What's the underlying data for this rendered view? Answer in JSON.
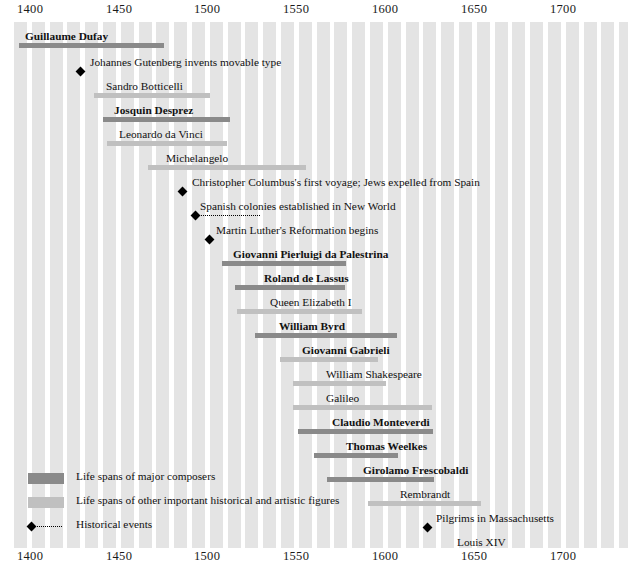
{
  "chart_data": {
    "type": "bar",
    "xlabel": "Year",
    "ylabel": "",
    "xlim": [
      1400,
      1745
    ],
    "grid": "vertical alternating bands every 10 years",
    "legend_position": "bottom-left",
    "axis": {
      "ticks": [
        1400,
        1450,
        1500,
        1550,
        1600,
        1650,
        1700
      ],
      "tick_labels": [
        "1400",
        "1450",
        "1500",
        "1550",
        "1600",
        "1650",
        "1700"
      ],
      "shown_top": true,
      "shown_bottom": true
    },
    "series": [
      {
        "name": "Life spans of major composers",
        "color": "#8a8a8a",
        "items": [
          {
            "label": "Guillaume Dufay",
            "start": 1400,
            "end": 1474
          },
          {
            "label": "Josquin Desprez",
            "start": 1450,
            "end": 1521
          },
          {
            "label": "Giovanni Pierluigi da Palestrina",
            "start": 1525,
            "end": 1594
          },
          {
            "label": "Roland de Lassus",
            "start": 1532,
            "end": 1594
          },
          {
            "label": "William Byrd",
            "start": 1543,
            "end": 1623
          },
          {
            "label": "Giovanni Gabrieli",
            "start": 1557,
            "end": 1612
          },
          {
            "label": "Claudio Monteverdi",
            "start": 1567,
            "end": 1643
          },
          {
            "label": "Thomas Weelkes",
            "start": 1576,
            "end": 1623
          },
          {
            "label": "Girolamo Frescobaldi",
            "start": 1583,
            "end": 1643
          },
          {
            "label": "Henry Purcell",
            "start": 1659,
            "end": 1695
          }
        ]
      },
      {
        "name": "Life spans of other important historical and artistic figures",
        "color": "#c0c0c0",
        "items": [
          {
            "label": "Sandro Botticelli",
            "start": 1445,
            "end": 1510
          },
          {
            "label": "Leonardo da Vinci",
            "start": 1452,
            "end": 1519
          },
          {
            "label": "Michelangelo",
            "start": 1475,
            "end": 1564
          },
          {
            "label": "Queen Elizabeth I",
            "start": 1533,
            "end": 1603
          },
          {
            "label": "William Shakespeare",
            "start": 1564,
            "end": 1616
          },
          {
            "label": "Galileo",
            "start": 1564,
            "end": 1642
          },
          {
            "label": "Rembrandt",
            "start": 1606,
            "end": 1669
          },
          {
            "label": "Louis XIV",
            "start": 1638,
            "end": 1715
          },
          {
            "label": "Isaac Newton",
            "start": 1642,
            "end": 1727
          }
        ]
      },
      {
        "name": "Historical events",
        "color": "#000000",
        "items": [
          {
            "label": "Johannes Gutenberg invents movable type",
            "start": 1439,
            "end": 1439
          },
          {
            "label": "Christopher Columbus's first voyage; Jews expelled from Spain",
            "start": 1492,
            "end": 1492
          },
          {
            "label": "Spanish colonies established in New World",
            "start": 1500,
            "end": 1535
          },
          {
            "label": "Martin Luther's Reformation begins",
            "start": 1517,
            "end": 1517
          },
          {
            "label": "Pilgrims in Massachusetts",
            "start": 1620,
            "end": 1620
          }
        ]
      }
    ]
  },
  "axis_ticks": [
    {
      "label": "1400",
      "x": 17
    },
    {
      "label": "1450",
      "x": 106
    },
    {
      "label": "1500",
      "x": 194
    },
    {
      "label": "1550",
      "x": 283
    },
    {
      "label": "1600",
      "x": 372
    },
    {
      "label": "1650",
      "x": 461
    },
    {
      "label": "1700",
      "x": 550
    }
  ],
  "rows": [
    {
      "kind": "composer",
      "label": "Guillaume Dufay",
      "bold": true,
      "top": 8,
      "labelX": 11,
      "barX": 5,
      "barW": 145
    },
    {
      "kind": "event",
      "label": "Johannes Gutenberg invents movable type",
      "bold": false,
      "top": 34,
      "labelX": 76,
      "barX": 63,
      "barW": 0
    },
    {
      "kind": "figure",
      "label": "Sandro Botticelli",
      "bold": false,
      "top": 58,
      "labelX": 92,
      "barX": 80,
      "barW": 116
    },
    {
      "kind": "composer",
      "label": "Josquin Desprez",
      "bold": true,
      "top": 82,
      "labelX": 100,
      "barX": 89,
      "barW": 127
    },
    {
      "kind": "figure",
      "label": "Leonardo da Vinci",
      "bold": false,
      "top": 106,
      "labelX": 105,
      "barX": 93,
      "barW": 120
    },
    {
      "kind": "figure",
      "label": "Michelangelo",
      "bold": false,
      "top": 130,
      "labelX": 152,
      "barX": 134,
      "barW": 158
    },
    {
      "kind": "event",
      "label": "Christopher Columbus's first voyage; Jews expelled from Spain",
      "bold": false,
      "top": 154,
      "labelX": 178,
      "barX": 165,
      "barW": 0
    },
    {
      "kind": "event",
      "label": "Spanish colonies established in New World",
      "bold": false,
      "top": 178,
      "labelX": 186,
      "barX": 178,
      "barW": 62
    },
    {
      "kind": "event",
      "label": "Martin Luther's Reformation begins",
      "bold": false,
      "top": 202,
      "labelX": 202,
      "barX": 192,
      "barW": 0
    },
    {
      "kind": "composer",
      "label": "Giovanni Pierluigi da Palestrina",
      "bold": true,
      "top": 226,
      "labelX": 219,
      "barX": 208,
      "barW": 124
    },
    {
      "kind": "composer",
      "label": "Roland de Lassus",
      "bold": true,
      "top": 250,
      "labelX": 250,
      "barX": 221,
      "barW": 110
    },
    {
      "kind": "figure",
      "label": "Queen Elizabeth I",
      "bold": false,
      "top": 274,
      "labelX": 256,
      "barX": 223,
      "barW": 125
    },
    {
      "kind": "composer",
      "label": "William Byrd",
      "bold": true,
      "top": 298,
      "labelX": 265,
      "barX": 241,
      "barW": 142
    },
    {
      "kind": "figure",
      "label": "Giovanni Gabrieli",
      "bold": true,
      "top": 322,
      "labelX": 288,
      "barX": 266,
      "barW": 98
    },
    {
      "kind": "figure",
      "label": "William Shakespeare",
      "bold": false,
      "top": 346,
      "labelX": 312,
      "barX": 279,
      "barW": 93
    },
    {
      "kind": "figure",
      "label": "Galileo",
      "bold": false,
      "top": 370,
      "labelX": 312,
      "barX": 279,
      "barW": 139
    },
    {
      "kind": "composer",
      "label": "Claudio Monteverdi",
      "bold": true,
      "top": 394,
      "labelX": 318,
      "barX": 284,
      "barW": 135
    },
    {
      "kind": "composer",
      "label": "Thomas Weelkes",
      "bold": true,
      "top": 418,
      "labelX": 332,
      "barX": 300,
      "barW": 84
    },
    {
      "kind": "composer",
      "label": "Girolamo Frescobaldi",
      "bold": true,
      "top": 442,
      "labelX": 349,
      "barX": 313,
      "barW": 107
    },
    {
      "kind": "figure",
      "label": "Rembrandt",
      "bold": false,
      "top": 466,
      "labelX": 386,
      "barX": 354,
      "barW": 113
    },
    {
      "kind": "event",
      "label": "Pilgrims in Massachusetts",
      "bold": false,
      "top": 490,
      "labelX": 422,
      "barX": 410,
      "barW": 0
    },
    {
      "kind": "figure",
      "label": "Louis XIV",
      "bold": false,
      "top": 514,
      "labelX": 443,
      "barX": 411,
      "barW": 138
    },
    {
      "kind": "figure",
      "label": "Isaac Newton",
      "bold": false,
      "top": 538,
      "labelX": 452,
      "barX": 418,
      "barW": 153
    },
    {
      "kind": "composer",
      "label": "Henry Purcell",
      "bold": true,
      "top": 562,
      "labelX": 478,
      "barX": 449,
      "barW": 67
    }
  ],
  "legend": {
    "items": [
      {
        "type": "composer",
        "top": 0,
        "text": "Life spans of major composers"
      },
      {
        "type": "figure",
        "top": 24,
        "text": "Life spans of other important historical and artistic figures"
      },
      {
        "type": "event",
        "top": 48,
        "text": "Historical events"
      }
    ]
  }
}
